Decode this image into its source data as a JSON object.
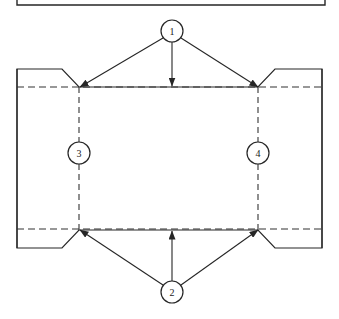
{
  "drawing": {
    "title": "Engineering assembly cross-section with numbered balloon callouts",
    "stroke_color": "#262626",
    "dashed_color": "#333333",
    "background_color": "#ffffff",
    "frame": {
      "name": "partial-title-box",
      "x": 17,
      "y": -30,
      "width": 308,
      "height": 35
    },
    "body": {
      "name": "main-rectangle",
      "left": 17,
      "right": 322,
      "top": 69,
      "bottom": 248,
      "chamfer_inset_x": 45,
      "chamfer_drop": 18
    },
    "construction_lines": {
      "horizontal": [
        87,
        229
      ],
      "vertical": [
        79,
        258
      ]
    },
    "balloons": [
      {
        "id": "balloon-1",
        "label": "1",
        "cx": 172,
        "cy": 31,
        "r": 11,
        "leaders": [
          {
            "x1": 163,
            "y1": 38,
            "x2": 80,
            "y2": 87,
            "arrow": true
          },
          {
            "x1": 172,
            "y1": 42,
            "x2": 172,
            "y2": 86,
            "arrow": true
          },
          {
            "x1": 181,
            "y1": 38,
            "x2": 258,
            "y2": 87,
            "arrow": true
          }
        ]
      },
      {
        "id": "balloon-2",
        "label": "2",
        "cx": 172,
        "cy": 292,
        "r": 11,
        "leaders": [
          {
            "x1": 163,
            "y1": 285,
            "x2": 80,
            "y2": 230,
            "arrow": true
          },
          {
            "x1": 172,
            "y1": 281,
            "x2": 172,
            "y2": 231,
            "arrow": true
          },
          {
            "x1": 181,
            "y1": 285,
            "x2": 258,
            "y2": 230,
            "arrow": true
          }
        ]
      },
      {
        "id": "balloon-3",
        "label": "3",
        "cx": 79,
        "cy": 153,
        "r": 11,
        "leaders": []
      },
      {
        "id": "balloon-4",
        "label": "4",
        "cx": 258,
        "cy": 153,
        "r": 11,
        "leaders": []
      }
    ]
  }
}
